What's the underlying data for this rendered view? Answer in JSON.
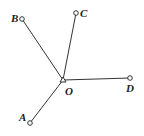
{
  "diagram": {
    "colors": {
      "line": "#333333",
      "point_stroke": "#333333",
      "point_fill": "#ffffff",
      "text": "#222222"
    },
    "vertex": {
      "label": "O",
      "x": 63,
      "y": 80
    },
    "rays": [
      {
        "label": "A",
        "x": 30,
        "y": 123
      },
      {
        "label": "B",
        "x": 22,
        "y": 19
      },
      {
        "label": "C",
        "x": 76,
        "y": 13
      },
      {
        "label": "D",
        "x": 130,
        "y": 78
      }
    ]
  }
}
